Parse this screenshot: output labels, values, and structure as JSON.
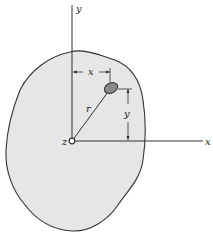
{
  "diagram": {
    "type": "moment-of-inertia-area-diagram",
    "colors": {
      "region_fill": "#e6e6e6",
      "outline": "#333333",
      "particle_fill": "#8a8a8a",
      "background": "#ffffff"
    },
    "labels": {
      "y_axis": "y",
      "x_axis": "x",
      "z_axis": "z",
      "radius": "r",
      "x_dimension": "x",
      "y_dimension": "y"
    }
  }
}
